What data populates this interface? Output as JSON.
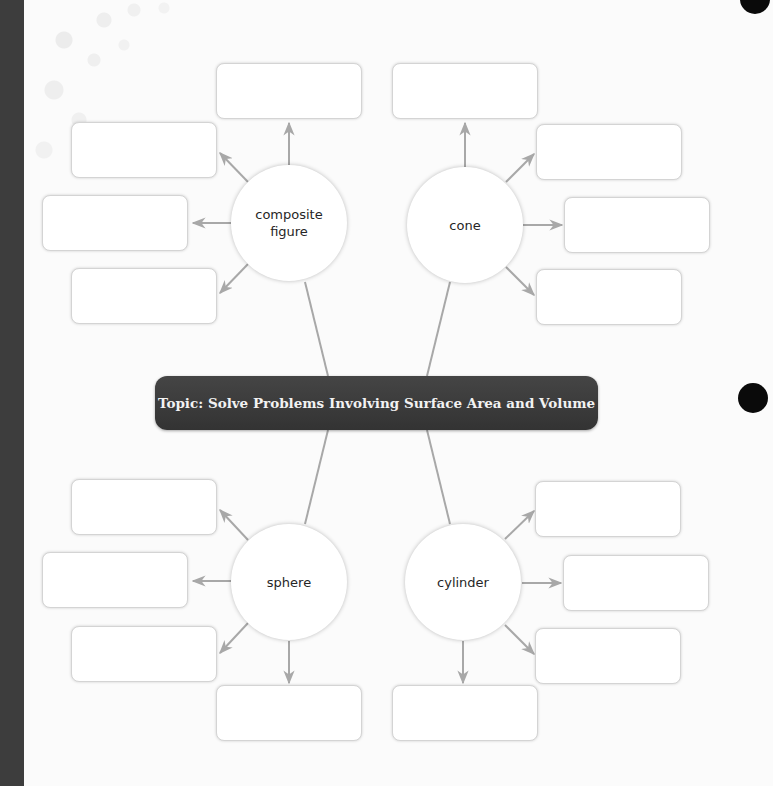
{
  "topic": {
    "label": "Topic: Solve Problems Involving Surface Area and Volume"
  },
  "nodes": [
    {
      "id": "composite",
      "label": "composite figure",
      "boxes": 4
    },
    {
      "id": "cone",
      "label": "cone",
      "boxes": 4
    },
    {
      "id": "sphere",
      "label": "sphere",
      "boxes": 4
    },
    {
      "id": "cylinder",
      "label": "cylinder",
      "boxes": 4
    }
  ],
  "colors": {
    "spine": "#3d3d3d",
    "topic_bg": "#3a3a3a",
    "topic_text": "#f2f2f2",
    "connector": "#a8a8a8",
    "box_border": "#d4d4d4",
    "binder_hole": "#0a0a0a"
  },
  "answer_boxes": {
    "composite": [
      "",
      "",
      "",
      ""
    ],
    "cone": [
      "",
      "",
      "",
      ""
    ],
    "sphere": [
      "",
      "",
      "",
      ""
    ],
    "cylinder": [
      "",
      "",
      "",
      ""
    ]
  }
}
